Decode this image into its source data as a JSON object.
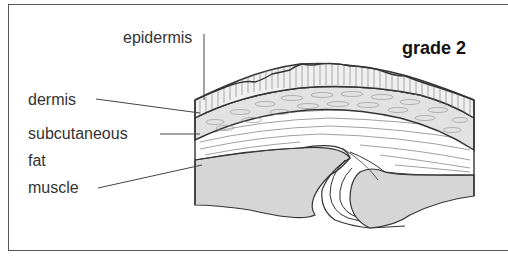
{
  "diagram": {
    "title": "grade 2",
    "labels": {
      "epidermis": "epidermis",
      "dermis": "dermis",
      "subcutaneous": "subcutaneous",
      "fat": "fat",
      "muscle": "muscle"
    },
    "colors": {
      "outline": "#333333",
      "bone_fill": "#d6d6d6",
      "dermis_fill": "#e2e2e2",
      "epidermis_fill": "#f0f0f0",
      "background": "#ffffff",
      "frame": "#555555"
    }
  }
}
